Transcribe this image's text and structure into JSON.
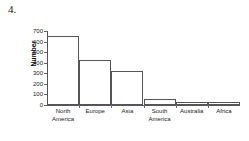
{
  "question": {
    "number": "4."
  },
  "chart_data": {
    "type": "bar",
    "title": "",
    "xlabel": "",
    "ylabel": "Number",
    "categories": [
      "North America",
      "Europe",
      "Asia",
      "South America",
      "Australia",
      "Africa"
    ],
    "category_lines": [
      [
        "North",
        "America"
      ],
      [
        "Europe"
      ],
      [
        "Asia"
      ],
      [
        "South",
        "America"
      ],
      [
        "Australia"
      ],
      [
        "Africa"
      ]
    ],
    "values": [
      650,
      425,
      320,
      57,
      30,
      28
    ],
    "ylim": [
      0,
      700
    ],
    "ytick_labels": [
      "700",
      "600",
      "500",
      "400",
      "300",
      "200",
      "100",
      "0"
    ],
    "ytick_values": [
      700,
      600,
      500,
      400,
      300,
      200,
      100,
      0
    ],
    "grid": false,
    "legend": false,
    "bar_fill": "#ffffff",
    "bar_edge": "#555557",
    "axis_color": "#58585a",
    "text_color": "#1a1a1a"
  }
}
